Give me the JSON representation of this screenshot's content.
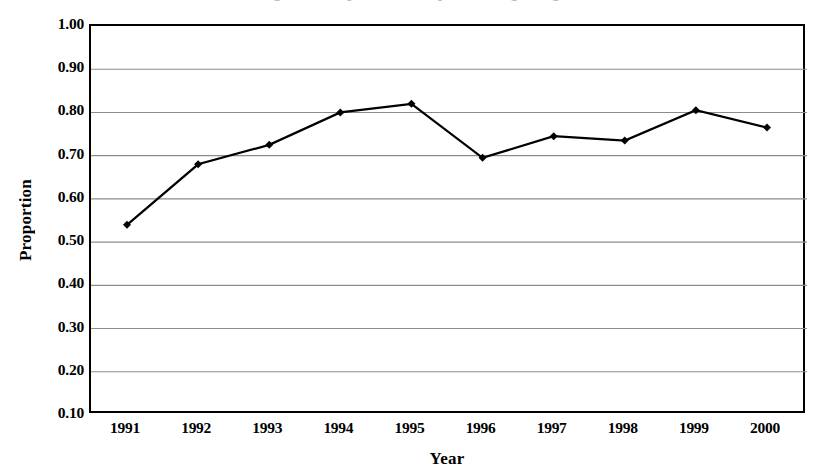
{
  "figure": {
    "title_remnant": "Figure 1. Proportion of respondents agreeing",
    "background_color": "#ffffff",
    "line_color": "#000000",
    "marker_color": "#000000",
    "grid_color": "#8c8c8c",
    "frame_color": "#000000"
  },
  "chart_data": {
    "type": "line",
    "title": "",
    "xlabel": "Year",
    "ylabel": "Proportion",
    "categories": [
      "1991",
      "1992",
      "1993",
      "1994",
      "1995",
      "1996",
      "1997",
      "1998",
      "1999",
      "2000"
    ],
    "values": [
      0.54,
      0.68,
      0.725,
      0.8,
      0.82,
      0.695,
      0.745,
      0.735,
      0.805,
      0.765
    ],
    "series": [
      {
        "name": "Proportion",
        "values": [
          0.54,
          0.68,
          0.725,
          0.8,
          0.82,
          0.695,
          0.745,
          0.735,
          0.805,
          0.765
        ]
      }
    ],
    "ylim": [
      0.1,
      1.0
    ],
    "ytick_step": 0.1,
    "ytick_labels": [
      "1.00",
      "0.90",
      "0.80",
      "0.70",
      "0.60",
      "0.50",
      "0.40",
      "0.30",
      "0.20",
      "0.10"
    ],
    "ytick_values": [
      1.0,
      0.9,
      0.8,
      0.7,
      0.6,
      0.5,
      0.4,
      0.3,
      0.2,
      0.1
    ],
    "xtick_labels": [
      "1991",
      "1992",
      "1993",
      "1994",
      "1995",
      "1996",
      "1997",
      "1998",
      "1999",
      "2000"
    ],
    "grid": "horizontal",
    "legend": "none",
    "marker": "diamond"
  }
}
